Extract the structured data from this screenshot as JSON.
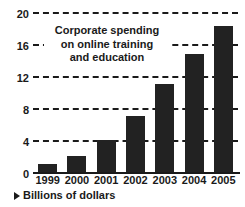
{
  "chart_data": {
    "type": "bar",
    "title_lines": [
      "Corporate spending",
      "on online training",
      "and education"
    ],
    "categories": [
      "1999",
      "2000",
      "2001",
      "2002",
      "2003",
      "2004",
      "2005"
    ],
    "values": [
      1,
      2,
      4,
      7,
      11,
      14.8,
      18.2
    ],
    "xlabel": "",
    "ylabel": "",
    "unit_caption": "Billions of dollars",
    "ylim": [
      0,
      20
    ],
    "yticks": [
      0,
      4,
      8,
      12,
      16,
      20
    ],
    "ytick_labels": [
      "0",
      "4",
      "8",
      "12",
      "16",
      "20"
    ],
    "grid": true,
    "grid_style": "dashed",
    "legend": "none",
    "bar_color": "#222222",
    "axis_color": "#1a1a1a",
    "background": "#ffffff"
  },
  "footnote": {
    "arrow_icon": "triangle-right-icon",
    "text": "Billions of dollars"
  }
}
